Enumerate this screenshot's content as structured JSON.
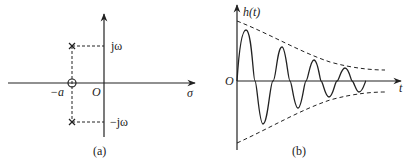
{
  "panel_a": {
    "caption": "(a)",
    "axis_x_label": "σ",
    "origin_label": "O",
    "zero_label": "−a",
    "pole_upper_label": "jω",
    "pole_lower_label": "−jω"
  },
  "panel_b": {
    "caption": "(b)",
    "axis_y_label": "h(t)",
    "axis_x_label": "t",
    "origin_label": "O"
  },
  "colors": {
    "ink": "#222222",
    "background": "#ffffff"
  }
}
